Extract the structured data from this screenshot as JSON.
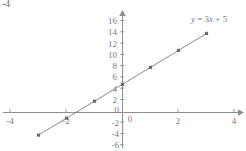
{
  "artifact": {
    "text": "-4",
    "superscript": "|"
  },
  "chart_data": {
    "type": "line",
    "title": "",
    "equation_label": "y = 3x + 5",
    "equation_parts": {
      "y": "y",
      "equals": " = 3",
      "x": "x",
      "plus": " + 5"
    },
    "xlabel": "",
    "ylabel": "",
    "xlim": [
      -4.4,
      4.4
    ],
    "ylim": [
      -6.9,
      17.2
    ],
    "grid": false,
    "legend_position": "top-right",
    "x_ticks": [
      -4,
      -2,
      0,
      2,
      4
    ],
    "x_tick_labels": [
      "-4",
      "-2",
      "0",
      "2",
      "4"
    ],
    "y_ticks": [
      -6,
      -4,
      -2,
      0,
      2,
      4,
      6,
      8,
      10,
      12,
      14,
      16
    ],
    "y_tick_labels": [
      "-6",
      "-4",
      "-2",
      "0",
      "2",
      "4",
      "6",
      "8",
      "10",
      "12",
      "14",
      "16"
    ],
    "x": [
      -3,
      -2,
      -1,
      0,
      1,
      2,
      3
    ],
    "values": [
      -4,
      -1,
      2,
      5,
      8,
      11,
      14
    ],
    "series": [
      {
        "name": "y = 3x + 5",
        "x": [
          -3,
          -2,
          -1,
          0,
          1,
          2,
          3
        ],
        "values": [
          -4,
          -1,
          2,
          5,
          8,
          11,
          14
        ]
      }
    ],
    "slope": 3,
    "intercept": 5,
    "colors": {
      "line": "#8a8a8a",
      "point": "#6b6b6b",
      "axis": "#8e8e8e",
      "tick_text": "#7a7a7a",
      "background": "#ffffff"
    }
  }
}
